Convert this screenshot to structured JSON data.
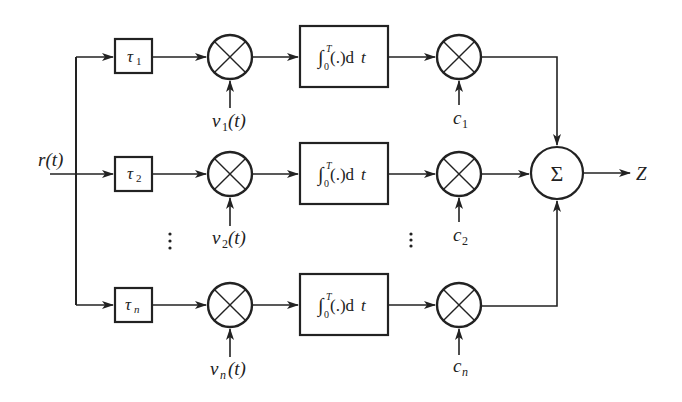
{
  "diagram": {
    "type": "block-diagram",
    "input": {
      "label": "r(t)"
    },
    "output": {
      "label": "Z"
    },
    "rows": [
      {
        "delay": {
          "sym": "τ",
          "sub": "1"
        },
        "ref": {
          "sym": "v",
          "sub": "1",
          "arg": "(t)"
        },
        "integrator": {
          "label": "∫",
          "upper": "T",
          "lower": "0",
          "body": "(.)d",
          "var": "t"
        },
        "coef": {
          "sym": "c",
          "sub": "1"
        }
      },
      {
        "delay": {
          "sym": "τ",
          "sub": "2"
        },
        "ref": {
          "sym": "v",
          "sub": "2",
          "arg": "(t)"
        },
        "integrator": {
          "label": "∫",
          "upper": "T",
          "lower": "0",
          "body": "(.)d",
          "var": "t"
        },
        "coef": {
          "sym": "c",
          "sub": "2"
        }
      },
      {
        "delay": {
          "sym": "τ",
          "sub": "n"
        },
        "ref": {
          "sym": "v",
          "sub": "n",
          "arg": "(t)"
        },
        "integrator": {
          "label": "∫",
          "upper": "T",
          "lower": "0",
          "body": "(.)d",
          "var": "t"
        },
        "coef": {
          "sym": "c",
          "sub": "n"
        }
      }
    ],
    "summer": {
      "label": "Σ"
    },
    "ellipsis": "⋮",
    "colors": {
      "stroke": "#222222",
      "background": "#ffffff"
    }
  }
}
